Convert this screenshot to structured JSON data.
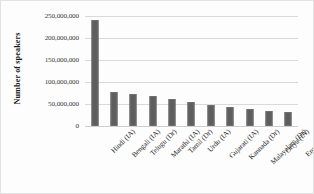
{
  "chart_data": {
    "type": "bar",
    "title": "",
    "subtitle": "",
    "xlabel": "",
    "ylabel": "Number of speakers",
    "ylim": [
      0,
      250000000
    ],
    "grid": true,
    "legend": false,
    "legend_position": "none",
    "bar_color": "#5e5e5e",
    "gridline_color": "#d9d9d9",
    "categories": [
      "Hindi (IA)",
      "Bengali (IA)",
      "Telugu (Dr)",
      "Marathi (IA)",
      "Tamil (Dr)",
      "Urdu (IA)",
      "Gujarati (IA)",
      "Kannada (Dr)",
      "Malayalam (Dr)",
      "Oriya (IA)",
      "English (IE)"
    ],
    "values": [
      241000000,
      77000000,
      73000000,
      68000000,
      61000000,
      55000000,
      48000000,
      43000000,
      38000000,
      34000000,
      32000000
    ],
    "yticks": [
      0,
      50000000,
      100000000,
      150000000,
      200000000,
      250000000
    ],
    "ytick_labels": [
      "0",
      "50,000,000",
      "100,000,000",
      "150,000,000",
      "200,000,000",
      "250,000,000"
    ]
  }
}
